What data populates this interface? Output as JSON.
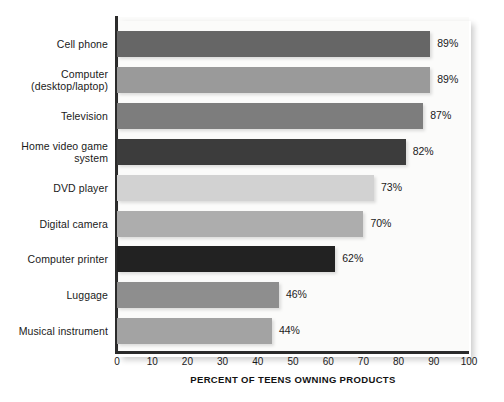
{
  "chart_data": {
    "type": "bar",
    "orientation": "horizontal",
    "title": "",
    "xlabel": "PERCENT OF TEENS OWNING PRODUCTS",
    "ylabel": "",
    "xlim": [
      0,
      100
    ],
    "grid": false,
    "legend": "none",
    "xticks": [
      "0",
      "10",
      "20",
      "30",
      "40",
      "50",
      "60",
      "70",
      "80",
      "90",
      "100"
    ],
    "xtick_values": [
      0,
      10,
      20,
      30,
      40,
      50,
      60,
      70,
      80,
      90,
      100
    ],
    "categories": [
      "Cell phone",
      "Computer\n(desktop/laptop)",
      "Television",
      "Home video game\nsystem",
      "DVD player",
      "Digital camera",
      "Computer printer",
      "Luggage",
      "Musical instrument"
    ],
    "values": [
      89,
      89,
      87,
      82,
      73,
      70,
      62,
      46,
      44
    ],
    "value_labels": [
      "89%",
      "89%",
      "87%",
      "82%",
      "73%",
      "70%",
      "62%",
      "46%",
      "44%"
    ],
    "bar_colors": [
      "#666666",
      "#9a9a9a",
      "#7d7d7d",
      "#3c3c3c",
      "#d2d2d2",
      "#adadad",
      "#222222",
      "#8e8e8e",
      "#a3a3a3"
    ],
    "series": [
      {
        "name": "Percent of teens owning products",
        "values": [
          89,
          89,
          87,
          82,
          73,
          70,
          62,
          46,
          44
        ]
      }
    ]
  },
  "bars": [
    {
      "label_line1": "Cell phone",
      "label_line2": "",
      "value": 89,
      "value_label": "89%",
      "color": "#666666"
    },
    {
      "label_line1": "Computer",
      "label_line2": "(desktop/laptop)",
      "value": 89,
      "value_label": "89%",
      "color": "#9a9a9a"
    },
    {
      "label_line1": "Television",
      "label_line2": "",
      "value": 87,
      "value_label": "87%",
      "color": "#7d7d7d"
    },
    {
      "label_line1": "Home video game",
      "label_line2": "system",
      "value": 82,
      "value_label": "82%",
      "color": "#3c3c3c"
    },
    {
      "label_line1": "DVD player",
      "label_line2": "",
      "value": 73,
      "value_label": "73%",
      "color": "#d2d2d2"
    },
    {
      "label_line1": "Digital camera",
      "label_line2": "",
      "value": 70,
      "value_label": "70%",
      "color": "#adadad"
    },
    {
      "label_line1": "Computer printer",
      "label_line2": "",
      "value": 62,
      "value_label": "62%",
      "color": "#222222"
    },
    {
      "label_line1": "Luggage",
      "label_line2": "",
      "value": 46,
      "value_label": "46%",
      "color": "#8e8e8e"
    },
    {
      "label_line1": "Musical instrument",
      "label_line2": "",
      "value": 44,
      "value_label": "44%",
      "color": "#a3a3a3"
    }
  ],
  "axis": {
    "x_title": "PERCENT OF TEENS OWNING PRODUCTS",
    "ticks": [
      "0",
      "10",
      "20",
      "30",
      "40",
      "50",
      "60",
      "70",
      "80",
      "90",
      "100"
    ]
  },
  "colors": {
    "axis_line": "#2b2b2b",
    "text": "#1a1a1a",
    "plot_background": "#fbfbfa",
    "page_background": "#ffffff"
  }
}
